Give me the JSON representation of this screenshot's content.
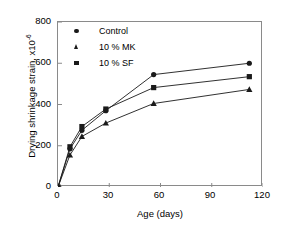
{
  "chart_data": {
    "type": "line",
    "title": "",
    "xlabel": "Age (days)",
    "ylabel_text": "Drying shrinkage strain, x10",
    "ylabel_exponent": "-6",
    "xlim": [
      0,
      120
    ],
    "ylim": [
      0,
      800
    ],
    "xticks": [
      0,
      30,
      60,
      90,
      120
    ],
    "yticks": [
      0,
      200,
      400,
      600,
      800
    ],
    "xtick_labels": [
      "0",
      "30",
      "60",
      "90",
      "120"
    ],
    "ytick_labels": [
      "0",
      "200",
      "400",
      "600",
      "800"
    ],
    "grid": false,
    "legend_position": "upper-left-inside",
    "x": [
      0,
      7,
      14,
      28,
      56,
      112
    ],
    "series": [
      {
        "name": "Control",
        "marker": "circle",
        "color": "#1a1a1a",
        "values": [
          0,
          185,
          275,
          370,
          545,
          600
        ]
      },
      {
        "name": "10 % MK",
        "marker": "triangle",
        "color": "#1a1a1a",
        "values": [
          0,
          155,
          245,
          310,
          405,
          473
        ]
      },
      {
        "name": "10 % SF",
        "marker": "square",
        "color": "#1a1a1a",
        "values": [
          0,
          195,
          293,
          378,
          482,
          535
        ]
      }
    ]
  },
  "legend": {
    "items": [
      {
        "label": "Control",
        "marker": "circle"
      },
      {
        "label": "10 % MK",
        "marker": "triangle"
      },
      {
        "label": "10 % SF",
        "marker": "square"
      }
    ]
  },
  "colors": {
    "axis": "#8a8a8a",
    "data": "#1a1a1a",
    "background": "#ffffff"
  }
}
